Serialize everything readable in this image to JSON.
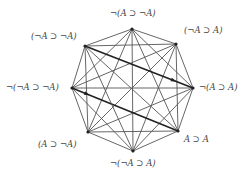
{
  "diagram": {
    "type": "complete-graph-octagon",
    "vertices": [
      {
        "id": "top",
        "label": "¬(A ⊃ ¬A)",
        "x": 132,
        "y": 29
      },
      {
        "id": "tr",
        "label": "(¬A ⊃ A)",
        "x": 176,
        "y": 44
      },
      {
        "id": "right",
        "label": "¬(A ⊃ A)",
        "x": 193,
        "y": 88
      },
      {
        "id": "br",
        "label": "A ⊃ A",
        "x": 178,
        "y": 131
      },
      {
        "id": "bottom",
        "label": "¬(¬A ⊃ A)",
        "x": 133,
        "y": 151
      },
      {
        "id": "bl",
        "label": "(A ⊃ ¬A)",
        "x": 88,
        "y": 132
      },
      {
        "id": "left",
        "label": "¬(¬A ⊃ ¬A)",
        "x": 72,
        "y": 88
      },
      {
        "id": "tl",
        "label": "(¬A ⊃ ¬A)",
        "x": 85,
        "y": 46
      }
    ],
    "highlighted_edges": [
      {
        "from": "tl",
        "to": "right",
        "arrow": "toward right"
      },
      {
        "from": "left",
        "to": "br",
        "arrow": "away from left"
      }
    ],
    "colors": {
      "edge": "#555555",
      "highlight": "#222222",
      "label": "#444444"
    }
  }
}
